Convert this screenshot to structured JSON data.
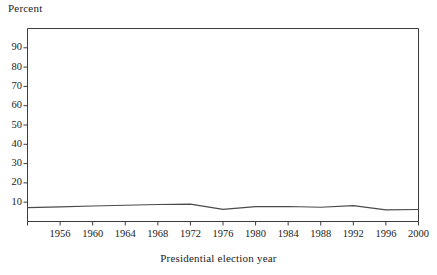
{
  "chart_data": {
    "type": "line",
    "title": "",
    "xlabel": "Presidential election year",
    "ylabel": "Percent",
    "ylim": [
      0,
      100
    ],
    "xlim": [
      1952,
      2000
    ],
    "yticks": [
      10,
      20,
      30,
      40,
      50,
      60,
      70,
      80,
      90
    ],
    "ytick_labels": [
      "10",
      "20",
      "30",
      "40",
      "50",
      "60",
      "70",
      "80",
      "90"
    ],
    "xticks": [
      1952,
      1956,
      1960,
      1964,
      1968,
      1972,
      1976,
      1980,
      1984,
      1988,
      1992,
      1996,
      2000
    ],
    "xtick_labels": [
      "",
      "1956",
      "1960",
      "1964",
      "1968",
      "1972",
      "1976",
      "1980",
      "1984",
      "1988",
      "1992",
      "1996",
      "2000"
    ],
    "grid": false,
    "legend": "none",
    "line_color": "#4a4a4a",
    "x": [
      1952,
      1956,
      1960,
      1964,
      1968,
      1972,
      1976,
      1980,
      1984,
      1988,
      1992,
      1996,
      2000
    ],
    "values": [
      7.2,
      7.6,
      8.0,
      8.4,
      8.8,
      9.0,
      6.3,
      7.7,
      7.8,
      7.4,
      8.2,
      6.0,
      6.2
    ],
    "series": [
      {
        "name": "Percent",
        "values": [
          7.2,
          7.6,
          8.0,
          8.4,
          8.8,
          9.0,
          6.3,
          7.7,
          7.8,
          7.4,
          8.2,
          6.0,
          6.2
        ]
      }
    ]
  },
  "axes": {
    "y_axis_caption": "Percent",
    "x_axis_caption": "Presidential election year"
  }
}
